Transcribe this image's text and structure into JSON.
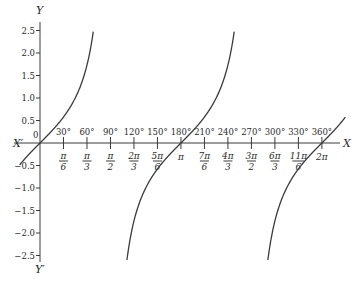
{
  "chart_data": {
    "type": "line",
    "title": "",
    "function": "y = tan x",
    "xlabel": "X",
    "xlabel_negative": "X′",
    "ylabel": "Y",
    "ylabel_negative": "Y′",
    "origin_label": "0",
    "xlim_degrees": [
      -25,
      395
    ],
    "ylim": [
      -2.6,
      2.6
    ],
    "grid": false,
    "legend": null,
    "y_ticks": [
      2.5,
      2.0,
      1.5,
      1.0,
      0.5,
      -0.5,
      -1.0,
      -1.5,
      -2.0,
      -2.5
    ],
    "y_tick_labels": [
      "2.5",
      "2.0",
      "1.5",
      "1.0",
      "0.5",
      "−0.5",
      "−1.0",
      "−1.5",
      "−2.0",
      "−2.5"
    ],
    "x_ticks_degrees": [
      30,
      60,
      90,
      120,
      150,
      180,
      210,
      240,
      270,
      300,
      330,
      360
    ],
    "x_tick_labels_degrees": [
      "30°",
      "60°",
      "90°",
      "120°",
      "150°",
      "180°",
      "210°",
      "240°",
      "270°",
      "300°",
      "330°",
      "360°"
    ],
    "x_tick_labels_radians": [
      {
        "num": "π",
        "den": "6"
      },
      {
        "num": "π",
        "den": "3"
      },
      {
        "num": "π",
        "den": "2"
      },
      {
        "num": "2π",
        "den": "3"
      },
      {
        "num": "5π",
        "den": "6"
      },
      {
        "num": "π",
        "den": ""
      },
      {
        "num": "7π",
        "den": "6"
      },
      {
        "num": "4π",
        "den": "3"
      },
      {
        "num": "3π",
        "den": "2"
      },
      {
        "num": "6π",
        "den": "3"
      },
      {
        "num": "11π",
        "den": "6"
      },
      {
        "num": "2π",
        "den": ""
      }
    ],
    "series": [
      {
        "name": "tan x (branch 1)",
        "x_degrees": [
          -26,
          -15,
          0,
          15,
          30,
          45,
          60,
          68
        ],
        "values": [
          -0.49,
          -0.27,
          0,
          0.27,
          0.58,
          1.0,
          1.73,
          2.48
        ]
      },
      {
        "name": "tan x (branch 2)",
        "x_degrees": [
          111,
          120,
          135,
          150,
          165,
          180,
          195,
          210,
          225,
          240,
          248
        ],
        "values": [
          -2.6,
          -1.73,
          -1.0,
          -0.58,
          -0.27,
          0,
          0.27,
          0.58,
          1.0,
          1.73,
          2.48
        ]
      },
      {
        "name": "tan x (branch 3)",
        "x_degrees": [
          291,
          300,
          315,
          330,
          345,
          360,
          375,
          390
        ],
        "values": [
          -2.6,
          -1.73,
          -1.0,
          -0.58,
          -0.27,
          0,
          0.27,
          0.58
        ]
      }
    ],
    "asymptotes_degrees": [
      90,
      270
    ]
  },
  "layout": {
    "origin_px": [
      40,
      143
    ],
    "px_per_degree": 0.783,
    "px_per_unit": 45,
    "x_axis_px": [
      14,
      340
    ],
    "y_axis_px": [
      22,
      262
    ]
  }
}
